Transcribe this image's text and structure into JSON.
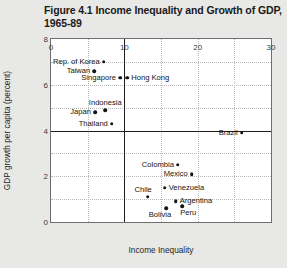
{
  "figure": {
    "title_line1": "Figure 4.1  Income Inequality and Growth of GDP,",
    "title_line2": "1965-89"
  },
  "chart_data": {
    "type": "scatter",
    "title": "Figure 4.1  Income Inequality and Growth of GDP, 1965-89",
    "xlabel": "Income Inequality",
    "ylabel": "GDP growth per capita (percent)",
    "xlim": [
      0,
      30
    ],
    "ylim": [
      0,
      8
    ],
    "xticks": [
      0,
      10,
      20,
      30
    ],
    "yticks": [
      0,
      2,
      4,
      6,
      8
    ],
    "grid": true,
    "grid_x_step": 5,
    "grid_y_step": 1,
    "legend": "none",
    "reference_lines": [
      {
        "axis": "x",
        "value": 10
      },
      {
        "axis": "y",
        "value": 4
      }
    ],
    "points": [
      {
        "name": "Rep. of Korea",
        "x": 7.2,
        "y": 7.0,
        "label_pos": "left"
      },
      {
        "name": "Taiwan",
        "x": 5.9,
        "y": 6.6,
        "label_pos": "left"
      },
      {
        "name": "Singapore",
        "x": 9.4,
        "y": 6.3,
        "label_pos": "left"
      },
      {
        "name": "Hong Kong",
        "x": 10.4,
        "y": 6.3,
        "label_pos": "right"
      },
      {
        "name": "Indonesia",
        "x": 7.4,
        "y": 4.9,
        "label_pos": "above"
      },
      {
        "name": "Japan",
        "x": 6.0,
        "y": 4.8,
        "label_pos": "left"
      },
      {
        "name": "Thailand",
        "x": 8.3,
        "y": 4.3,
        "label_pos": "left"
      },
      {
        "name": "Brazil",
        "x": 26.0,
        "y": 3.9,
        "label_pos": "left"
      },
      {
        "name": "Colombia",
        "x": 17.3,
        "y": 2.5,
        "label_pos": "left"
      },
      {
        "name": "Mexico",
        "x": 19.2,
        "y": 2.1,
        "label_pos": "left"
      },
      {
        "name": "Venezuela",
        "x": 15.5,
        "y": 1.5,
        "label_pos": "right"
      },
      {
        "name": "Chile",
        "x": 13.2,
        "y": 1.1,
        "label_pos": "above-left"
      },
      {
        "name": "Argentina",
        "x": 17.0,
        "y": 0.9,
        "label_pos": "right"
      },
      {
        "name": "Bolivia",
        "x": 15.7,
        "y": 0.6,
        "label_pos": "below-left"
      },
      {
        "name": "Peru",
        "x": 17.9,
        "y": 0.7,
        "label_pos": "below-right"
      }
    ]
  }
}
